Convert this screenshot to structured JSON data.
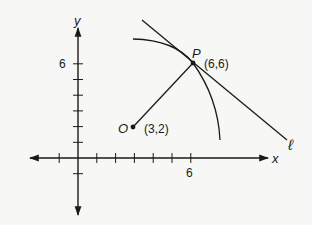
{
  "diagram": {
    "type": "coordinate-geometry",
    "axes": {
      "x_label": "x",
      "y_label": "y",
      "x_tick_label": "6",
      "y_tick_label": "6",
      "x_ticks": [
        -1,
        1,
        2,
        3,
        4,
        5,
        6
      ],
      "y_ticks": [
        -1,
        1,
        2,
        3,
        4,
        5,
        6
      ]
    },
    "points": [
      {
        "name": "O",
        "coords_label": "(3,2)",
        "x": 3,
        "y": 2
      },
      {
        "name": "P",
        "coords_label": "(6,6)",
        "x": 6,
        "y": 6
      }
    ],
    "segment": {
      "from": "O",
      "to": "P",
      "description": "radius OP"
    },
    "arc": {
      "center": "O",
      "through": "P",
      "description": "circular arc centered at O passing through P"
    },
    "line": {
      "name": "ℓ",
      "description": "line tangent to arc at P"
    },
    "colors": {
      "ink": "#1a1a1a",
      "background": "#f7f7f5"
    }
  }
}
